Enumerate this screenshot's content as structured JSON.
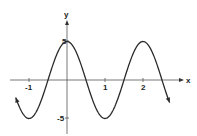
{
  "chart_data": {
    "type": "line",
    "title": "",
    "function": "y = 5cos(πx)",
    "xlabel": "x",
    "ylabel": "y",
    "xlim": [
      -1.35,
      2.7
    ],
    "ylim": [
      -5,
      5
    ],
    "x_ticks": [
      "-1",
      "1",
      "2"
    ],
    "y_ticks": [
      "5",
      "-5"
    ],
    "grid": false,
    "legend": null,
    "series": [
      {
        "name": "curve",
        "x": [
          -1.35,
          -1,
          -0.5,
          0,
          0.5,
          1,
          1.5,
          2,
          2.5,
          2.7
        ],
        "y": [
          -2.94,
          -5,
          0,
          5,
          0,
          -5,
          0,
          5,
          0,
          -2.94
        ]
      }
    ]
  },
  "axes": {
    "x_label": "x",
    "y_label": "y",
    "tick_neg1": "-1",
    "tick_1": "1",
    "tick_2": "2",
    "tick_5": "5",
    "tick_neg5": "-5"
  },
  "colors": {
    "curve": "#2a2a2a",
    "axis": "#555555"
  }
}
